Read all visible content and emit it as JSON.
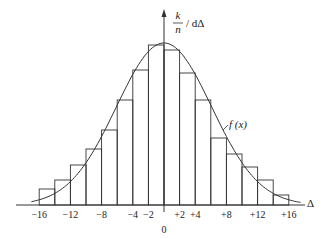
{
  "chart_data": {
    "type": "bar",
    "title": "",
    "xlabel": "Δ",
    "ylabel_numerator": "k",
    "ylabel_denominator": "n",
    "ylabel_suffix": "/ dΔ",
    "curve_label": "f (x)",
    "origin_label": "0",
    "bin_edges": [
      -16,
      -14,
      -12,
      -10,
      -8,
      -6,
      -4,
      -2,
      0,
      2,
      4,
      6,
      8,
      10,
      12,
      14,
      16
    ],
    "values": [
      16,
      25,
      40,
      56,
      75,
      105,
      135,
      160,
      155,
      132,
      105,
      67,
      51,
      38,
      25,
      10
    ],
    "curve": {
      "type": "normal-density",
      "mean": 0,
      "peak": 162,
      "sigma": 6.1,
      "x_range": [
        -17,
        17.5
      ]
    },
    "xlim": [
      -17.5,
      19
    ],
    "ylim": [
      0,
      175
    ],
    "xticks": [
      {
        "value": -16,
        "label": "−16"
      },
      {
        "value": -12,
        "label": "−12"
      },
      {
        "value": -8,
        "label": "−8"
      },
      {
        "value": -4,
        "label": "−4"
      },
      {
        "value": -2,
        "label": "−2"
      },
      {
        "value": 2,
        "label": "+2"
      },
      {
        "value": 4,
        "label": "+4"
      },
      {
        "value": 8,
        "label": "+8"
      },
      {
        "value": 12,
        "label": "+12"
      },
      {
        "value": 16,
        "label": "+16"
      }
    ],
    "grid": false,
    "colors": {
      "stroke": "#333333",
      "background": "#ffffff"
    }
  }
}
